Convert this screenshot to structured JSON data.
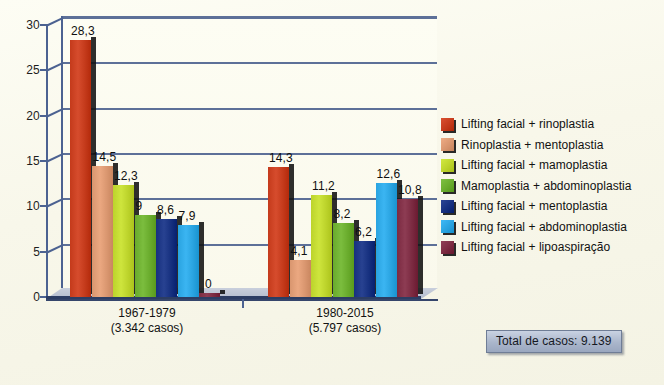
{
  "chart_data": {
    "type": "bar",
    "title": "",
    "subtitle": "",
    "xlabel": "",
    "ylabel": "",
    "ylim": [
      0,
      30
    ],
    "ytick_labels": [
      "0",
      "5",
      "10",
      "15",
      "20",
      "25",
      "30"
    ],
    "ytick_values": [
      0,
      5,
      10,
      15,
      20,
      25,
      30
    ],
    "grid": true,
    "legend_position": "right",
    "categories": [
      "1967-1979",
      "1980-2015"
    ],
    "category_sublabels": [
      "(3.342 casos)",
      "(5.797 casos)"
    ],
    "series": [
      {
        "name": "Lifting facial + rinoplastia",
        "color": "#c43a1b",
        "values": [
          28.3,
          14.3
        ],
        "labels": [
          "28,3",
          "14,3"
        ]
      },
      {
        "name": "Rinoplastia + mentoplastia",
        "color": "#d9966f",
        "values": [
          14.5,
          4.1
        ],
        "labels": [
          "14,5",
          "4,1"
        ]
      },
      {
        "name": "Lifting facial + mamoplastia",
        "color": "#bcd32b",
        "values": [
          12.3,
          11.2
        ],
        "labels": [
          "12,3",
          "11,2"
        ]
      },
      {
        "name": "Mamoplastia + abdominoplastia",
        "color": "#69ab2c",
        "values": [
          9,
          8.2
        ],
        "labels": [
          "9",
          "8,2"
        ]
      },
      {
        "name": "Lifting facial + mentoplastia",
        "color": "#16307f",
        "values": [
          8.6,
          6.2
        ],
        "labels": [
          "8,6",
          "6,2"
        ]
      },
      {
        "name": "Lifting facial + abdominoplastia",
        "color": "#29a3e0",
        "values": [
          7.9,
          12.6
        ],
        "labels": [
          "7,9",
          "12,6"
        ]
      },
      {
        "name": "Lifting facial + lipoaspiração",
        "color": "#7b2a41",
        "values": [
          0,
          10.8
        ],
        "labels": [
          "0",
          "10,8"
        ]
      }
    ]
  },
  "annotations": {
    "total_label": "Total de casos: 9.139"
  },
  "colors": {
    "background": "#faf9ec",
    "gridline": "#5d7098",
    "axis": "#4c6291",
    "text": "#111111",
    "total_box_fill": "#aab6cb",
    "total_box_border": "#6f7d96"
  }
}
